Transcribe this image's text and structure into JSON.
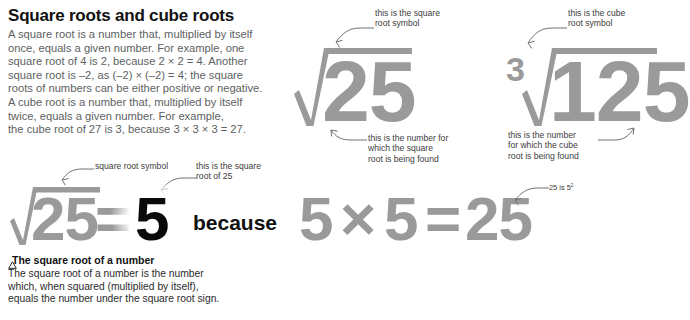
{
  "heading": "Square roots and cube roots",
  "intro_lines": [
    "A square root is a number that, multiplied by itself",
    "once, equals a given number. For example, one",
    "square root of 4 is 2, because 2 × 2 = 4. Another",
    "square root is –2, as (–2) × (–2) = 4; the square",
    "roots of numbers can be either positive or negative.",
    "A cube root is a number that, multiplied by itself",
    "twice, equals a given number. For example,",
    "the cube root of 27 is 3, because 3 × 3 × 3 = 27."
  ],
  "diagram_square_root": {
    "radicand": "25",
    "symbol_label_lines": [
      "this is the square",
      "root symbol"
    ],
    "radicand_label_lines": [
      "this is the number for",
      "which the square",
      "root is being found"
    ]
  },
  "diagram_cube_root": {
    "index": "3",
    "radicand": "125",
    "symbol_label_lines": [
      "this is the cube",
      "root symbol"
    ],
    "radicand_label_lines": [
      "this is the number",
      "for which the cube",
      "root is being found"
    ]
  },
  "equation_root": {
    "radicand": "25",
    "equals": "=",
    "result": "5",
    "because": "because",
    "symbol_label": "square root symbol",
    "result_label_lines": [
      "this is the square",
      "root of 25"
    ]
  },
  "equation_product": {
    "left": "5",
    "times": "×",
    "right": "5",
    "equals": "=",
    "product": "25",
    "note_prefix": "25 is 5",
    "note_exponent": "2"
  },
  "caption": {
    "marker": "triangle-icon",
    "title": "The square root of a number",
    "body_lines": [
      "The square root of a number is the number",
      "which, when squared (multiplied by itself),",
      "equals the number under the square root sign."
    ]
  },
  "colors": {
    "gray_math": "#9a9a9a",
    "body_text": "#5d5f61",
    "anno_text": "#3c3c3c",
    "black": "#0a0a0a",
    "background": "#ffffff"
  }
}
